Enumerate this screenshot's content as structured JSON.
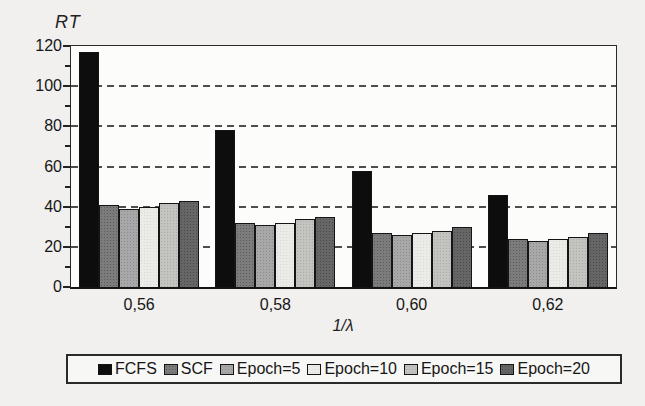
{
  "chart_data": {
    "type": "bar",
    "ylabel": "RT",
    "xlabel": "1/λ",
    "categories": [
      "0,56",
      "0,58",
      "0,60",
      "0,62"
    ],
    "series": [
      {
        "name": "FCFS",
        "values": [
          117,
          78,
          58,
          46
        ],
        "color": "#0d0d0d",
        "dot": ""
      },
      {
        "name": "SCF",
        "values": [
          41,
          32,
          27,
          24
        ],
        "color": "#7c7c7c",
        "dot": "#5a5a5a"
      },
      {
        "name": "Epoch=5",
        "values": [
          39,
          31,
          26,
          23
        ],
        "color": "#a8a8a8",
        "dot": "#8c8c8c"
      },
      {
        "name": "Epoch=10",
        "values": [
          40,
          32,
          27,
          24
        ],
        "color": "#ebebe8",
        "dot": "#d9d9d6"
      },
      {
        "name": "Epoch=15",
        "values": [
          42,
          34,
          28,
          25
        ],
        "color": "#c3c3c0",
        "dot": "#ababa8"
      },
      {
        "name": "Epoch=20",
        "values": [
          43,
          35,
          30,
          27
        ],
        "color": "#666666",
        "dot": "#4a4a4a"
      }
    ],
    "ylim": [
      0,
      120
    ],
    "y_major_ticks": [
      0,
      20,
      40,
      60,
      80,
      100,
      120
    ],
    "y_minor_ticks": [
      10,
      30,
      50,
      70,
      90,
      110
    ],
    "gridlines_at": [
      20,
      40,
      60,
      80,
      100
    ],
    "grid": "horizontal dashed",
    "legend_position": "bottom"
  }
}
